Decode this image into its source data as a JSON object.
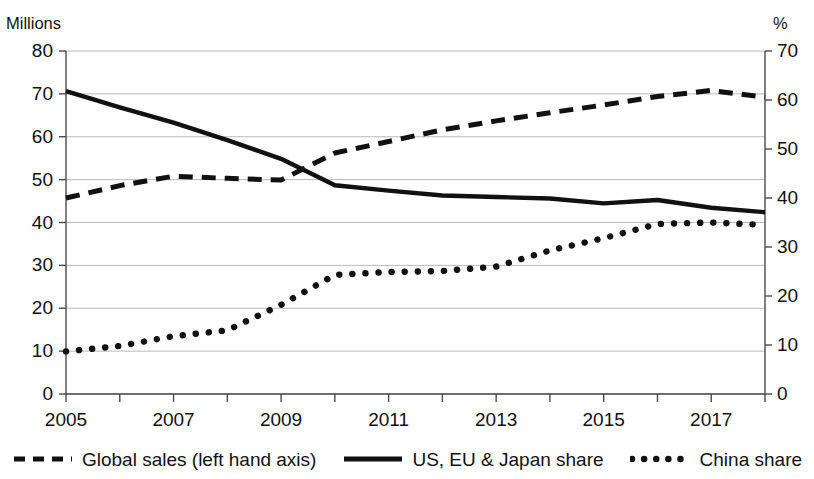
{
  "chart_data": {
    "type": "line",
    "title": "",
    "subtitle": "",
    "xlabel": "",
    "ylabel": "Millions",
    "y2label": "%",
    "grid": true,
    "legend_position": "bottom",
    "xlim": [
      2005,
      2018
    ],
    "ylim": [
      0,
      80
    ],
    "y2lim": [
      0,
      70
    ],
    "y_ticks": [
      0,
      10,
      20,
      30,
      40,
      50,
      60,
      70,
      80
    ],
    "y2_ticks": [
      0,
      10,
      20,
      30,
      40,
      50,
      60,
      70
    ],
    "x_tick_labels": [
      "2005",
      "2007",
      "2009",
      "2011",
      "2013",
      "2015",
      "2017"
    ],
    "x_tick_values": [
      2005,
      2007,
      2009,
      2011,
      2013,
      2015,
      2017
    ],
    "x": [
      2005,
      2006,
      2007,
      2008,
      2009,
      2010,
      2011,
      2012,
      2013,
      2014,
      2015,
      2016,
      2017,
      2018
    ],
    "series": [
      {
        "name": "Global sales (left hand axis)",
        "axis": "left",
        "style": "dashed",
        "color": "#111111",
        "units": "Millions",
        "values": [
          45.7,
          48.6,
          50.8,
          50.3,
          49.9,
          56.2,
          58.9,
          61.6,
          63.7,
          65.6,
          67.4,
          69.4,
          70.8,
          69.2
        ]
      },
      {
        "name": "US, EU & Japan share",
        "axis": "right",
        "style": "solid",
        "color": "#111111",
        "units": "%",
        "values": [
          61.8,
          58.5,
          55.4,
          51.8,
          48.0,
          42.6,
          41.5,
          40.5,
          40.2,
          39.9,
          38.9,
          39.6,
          38.0,
          37.1
        ]
      },
      {
        "name": "China share",
        "axis": "right",
        "style": "dotted",
        "color": "#111111",
        "units": "%",
        "values": [
          8.7,
          9.8,
          11.8,
          13.0,
          18.2,
          24.3,
          24.9,
          25.1,
          26.0,
          29.3,
          31.8,
          34.7,
          35.0,
          34.5
        ]
      }
    ]
  },
  "legend": {
    "items": [
      {
        "label": "Global sales (left hand axis)",
        "style": "dashed"
      },
      {
        "label": "US, EU & Japan share",
        "style": "solid"
      },
      {
        "label": "China share",
        "style": "dotted"
      }
    ]
  },
  "axes": {
    "left_unit": "Millions",
    "right_unit": "%"
  }
}
